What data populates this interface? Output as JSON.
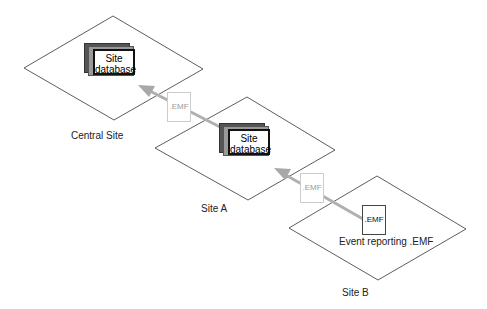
{
  "sites": [
    {
      "name": "Central Site",
      "db_line1": "Site",
      "db_line2": "database"
    },
    {
      "name": "Site A",
      "db_line1": "Site",
      "db_line2": "database"
    },
    {
      "name": "Site B",
      "file_label": ".EMF",
      "caption": "Event reporting .EMF"
    }
  ],
  "transfers": [
    {
      "file_label": ".EMF",
      "from": "Site A",
      "to": "Central Site"
    },
    {
      "file_label": ".EMF",
      "from": "Site B",
      "to": "Site A"
    }
  ],
  "colors": {
    "arrow": "#b0b0b0",
    "faded_doc": "#c8c8c8",
    "outline": "#333333"
  }
}
